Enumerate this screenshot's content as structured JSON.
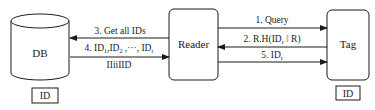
{
  "nodes": {
    "db": {
      "label": "DB",
      "id_label": "ID"
    },
    "reader": {
      "label": "Reader"
    },
    "tag": {
      "label": "Tag",
      "id_label": "ID"
    }
  },
  "edges": [
    {
      "step": "1",
      "label": "1. Query",
      "from": "Reader",
      "to": "Tag"
    },
    {
      "step": "2",
      "label_main": "2. R.H(ID",
      "label_sub": "r",
      "label_sep": " ‖ ",
      "label_end": "R)",
      "from": "Tag",
      "to": "Reader"
    },
    {
      "step": "3",
      "label": "3. Get all IDs",
      "from": "Reader",
      "to": "DB"
    },
    {
      "step": "4",
      "label_parts": [
        "4. ID",
        "1",
        ",ID",
        "2",
        " ,···, ID",
        "r"
      ],
      "sublabel": "IIiiIID",
      "from": "DB",
      "to": "Reader"
    },
    {
      "step": "5",
      "label_main": "5. ID",
      "label_sub": "r",
      "from": "Reader",
      "to": "Tag"
    }
  ],
  "colors": {
    "stroke": "#1a1a1a",
    "background": "#ffffff"
  }
}
